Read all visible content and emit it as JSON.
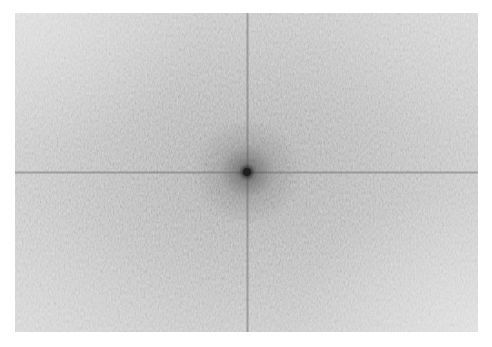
{
  "image": {
    "description": "2D Fourier transform magnitude spectrum (log-scaled, grayscale) with bright DC component at center and horizontal/vertical axis lines",
    "region": {
      "left": 15,
      "top": 13,
      "width": 463,
      "height": 319
    },
    "center": {
      "x": 232,
      "y": 159
    },
    "colors": {
      "background": "#ffffff",
      "center_dark": "#1e1e1e",
      "mid_gray": "#a0a0a0",
      "edge_light": "#c6c6c6"
    },
    "features": [
      "dc-peak",
      "horizontal-axis-line",
      "vertical-axis-line",
      "speckle-noise-texture"
    ]
  }
}
